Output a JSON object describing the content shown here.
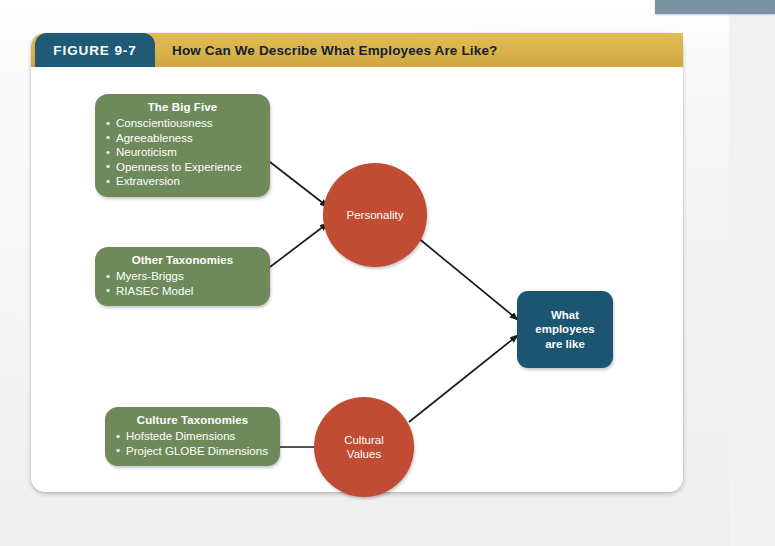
{
  "figure": {
    "number_label": "FIGURE 9-7",
    "title": "How Can We Describe What Employees Are Like?"
  },
  "colors": {
    "figure_tab": "#1f5a77",
    "title_band": "#d9b24a",
    "green_box": "#6f8a5a",
    "red_circle": "#c04c33",
    "outcome_box": "#1b5571",
    "page_background": "#f2f2f2",
    "card_background": "#ffffff",
    "top_tab": "#7b93a3",
    "connector_line": "#1a1a1a"
  },
  "diagram": {
    "type": "flow-diagram",
    "green_boxes": [
      {
        "id": "big-five",
        "title": "The Big Five",
        "items": [
          "Conscientiousness",
          "Agreeableness",
          "Neuroticism",
          "Openness to Experience",
          "Extraversion"
        ]
      },
      {
        "id": "other-taxonomies",
        "title": "Other Taxonomies",
        "items": [
          "Myers-Briggs",
          "RIASEC Model"
        ]
      },
      {
        "id": "culture-taxonomies",
        "title": "Culture Taxonomies",
        "items": [
          "Hofstede Dimensions",
          "Project GLOBE Dimensions"
        ]
      }
    ],
    "circles": [
      {
        "id": "personality",
        "label": "Personality"
      },
      {
        "id": "cultural-values",
        "label": "Cultural\nValues",
        "line1": "Cultural",
        "line2": "Values"
      }
    ],
    "outcome": {
      "id": "what-employees-are-like",
      "line1": "What",
      "line2": "employees",
      "line3": "are like"
    },
    "connections": [
      {
        "from": "big-five",
        "to": "personality",
        "arrow": true
      },
      {
        "from": "other-taxonomies",
        "to": "personality",
        "arrow": true
      },
      {
        "from": "culture-taxonomies",
        "to": "cultural-values",
        "arrow": false
      },
      {
        "from": "personality",
        "to": "what-employees-are-like",
        "arrow": true
      },
      {
        "from": "cultural-values",
        "to": "what-employees-are-like",
        "arrow": true
      }
    ]
  }
}
